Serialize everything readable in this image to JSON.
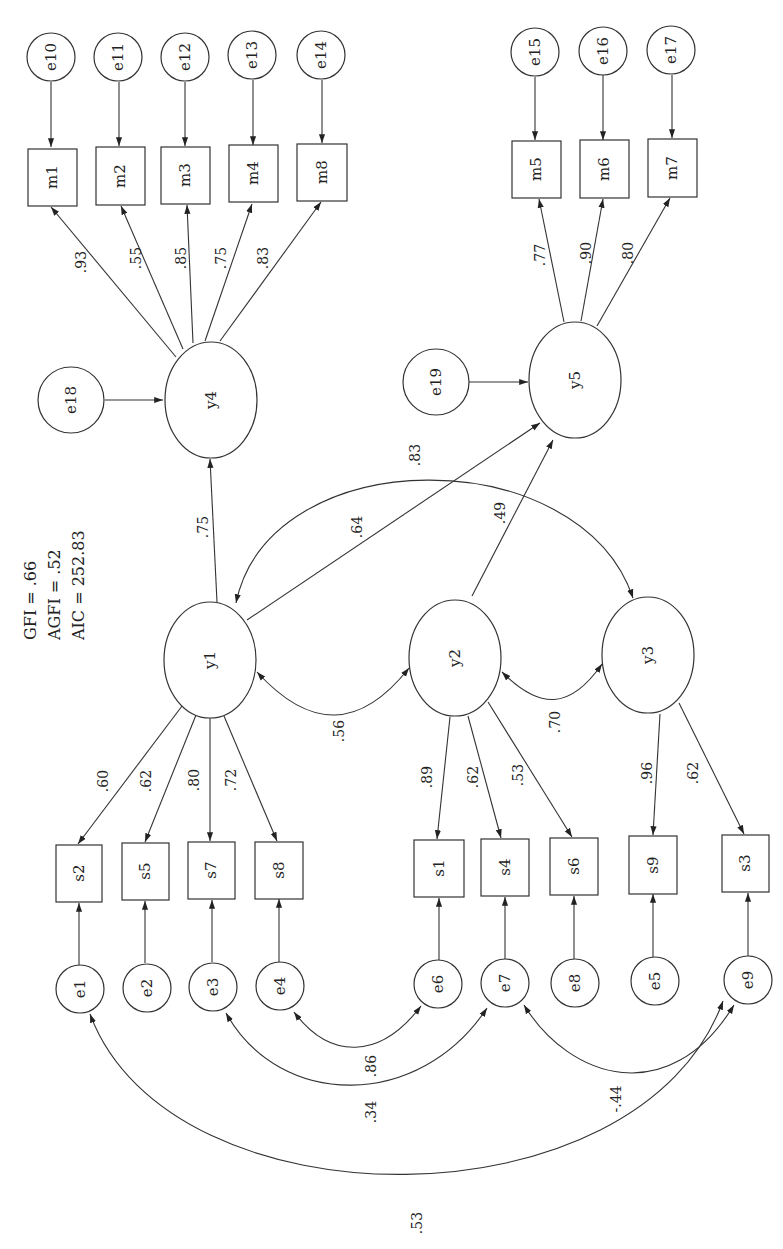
{
  "diagram": {
    "type": "structural-equation-model",
    "orientation": "rotated-90",
    "fit_indices": {
      "gfi": "GFI = .66",
      "agfi": "AGFI = .52",
      "aic": "AIC = 252.83"
    },
    "latent": {
      "y1": "y1",
      "y2": "y2",
      "y3": "y3",
      "y4": "y4",
      "y5": "y5"
    },
    "observed": {
      "s1": "s1",
      "s2": "s2",
      "s3": "s3",
      "s4": "s4",
      "s5": "s5",
      "s6": "s6",
      "s7": "s7",
      "s8": "s8",
      "s9": "s9",
      "m1": "m1",
      "m2": "m2",
      "m3": "m3",
      "m4": "m4",
      "m5": "m5",
      "m6": "m6",
      "m7": "m7",
      "m8": "m8"
    },
    "errors": {
      "e1": "e1",
      "e2": "e2",
      "e3": "e3",
      "e4": "e4",
      "e5": "e5",
      "e6": "e6",
      "e7": "e7",
      "e8": "e8",
      "e9": "e9",
      "e10": "e10",
      "e11": "e11",
      "e12": "e12",
      "e13": "e13",
      "e14": "e14",
      "e15": "e15",
      "e16": "e16",
      "e17": "e17",
      "e18": "e18",
      "e19": "e19"
    },
    "loadings": {
      "y1_s2": ".60",
      "y1_s5": ".62",
      "y1_s7": ".80",
      "y1_s8": ".72",
      "y2_s1": ".89",
      "y2_s4": ".62",
      "y2_s6": ".53",
      "y3_s9": ".96",
      "y3_s3": ".62",
      "y4_m1": ".93",
      "y4_m2": ".55",
      "y4_m3": ".85",
      "y4_m4": ".75",
      "y4_m8": ".83",
      "y5_m5": ".77",
      "y5_m6": ".90",
      "y5_m7": ".80"
    },
    "paths": {
      "y1_y4": ".75",
      "y1_y5": ".64",
      "y2_y5": ".49"
    },
    "correlations": {
      "y1_y2": ".56",
      "y2_y3": ".70",
      "y1_y3": ".83",
      "e4_e6": ".86",
      "e3_e7": ".34",
      "e7_e9": "-.44",
      "e1_e9": ".53"
    }
  }
}
